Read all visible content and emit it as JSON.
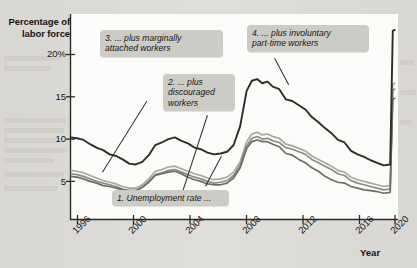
{
  "axes": {
    "y_title": "Percentage of\nlabor force",
    "x_title": "Year",
    "y_ticks": [
      "20%",
      "15",
      "10",
      "5"
    ],
    "x_ticks": [
      "1996",
      "2000",
      "2004",
      "2008",
      "2012",
      "2016",
      "2020"
    ]
  },
  "callouts": [
    {
      "id": "callout-1",
      "text": "1. Unemployment rate ..."
    },
    {
      "id": "callout-2",
      "text": "2. ... plus\ndiscouraged\nworkers"
    },
    {
      "id": "callout-3",
      "text": "3. ... plus marginally\nattached workers"
    },
    {
      "id": "callout-4",
      "text": "4. ... plus involuntary\npart-time workers"
    }
  ],
  "colors": {
    "page_background": "#d9d7d3",
    "plot_background": "#fbfbfa",
    "callout_background": "#cdcbc6",
    "axis": "#2b2926",
    "series_u6": "#2e2c29",
    "series_u5": "#a9a7a2",
    "series_u4": "#8d8b86",
    "series_u3": "#6e6c68"
  },
  "chart_data": {
    "type": "line",
    "title": "",
    "xlabel": "Year",
    "ylabel": "Percentage of labor force",
    "xlim": [
      1995.5,
      2020.6
    ],
    "ylim": [
      0,
      23.5
    ],
    "grid": false,
    "legend": "annotations-as-callouts",
    "xticks": [
      1996,
      2000,
      2004,
      2008,
      2012,
      2016,
      2020
    ],
    "yticks": [
      5,
      10,
      15,
      20
    ],
    "ytick_labels": [
      "5",
      "10",
      "15",
      "20%"
    ],
    "series": [
      {
        "name": "4. ... plus involuntary part-time workers",
        "key": "u6",
        "color": "#2e2c29",
        "x": [
          1995.5,
          1996,
          1996.5,
          1997,
          1997.5,
          1998,
          1998.5,
          1999,
          1999.5,
          2000,
          2000.5,
          2001,
          2001.5,
          2002,
          2002.5,
          2003,
          2003.5,
          2004,
          2004.5,
          2005,
          2005.5,
          2006,
          2006.5,
          2007,
          2007.5,
          2008,
          2008.5,
          2009,
          2009.4,
          2009.8,
          2010.2,
          2010.6,
          2011,
          2011.5,
          2012,
          2012.5,
          2013,
          2013.5,
          2014,
          2014.5,
          2015,
          2015.5,
          2016,
          2016.5,
          2017,
          2017.5,
          2018,
          2018.5,
          2019,
          2019.5,
          2020,
          2020.2,
          2020.35
        ],
        "y": [
          10.2,
          10.1,
          9.9,
          9.4,
          9.0,
          8.7,
          8.2,
          8.0,
          7.6,
          7.1,
          7.0,
          7.3,
          8.1,
          9.3,
          9.6,
          10.0,
          10.2,
          9.8,
          9.5,
          9.0,
          8.8,
          8.4,
          8.2,
          8.3,
          8.5,
          9.3,
          11.5,
          15.7,
          16.9,
          17.1,
          16.6,
          16.8,
          16.2,
          15.9,
          14.7,
          14.5,
          14.0,
          13.5,
          12.6,
          12.0,
          11.3,
          10.7,
          9.9,
          9.6,
          8.6,
          8.2,
          7.9,
          7.5,
          7.2,
          6.9,
          7.0,
          22.8,
          22.9
        ]
      },
      {
        "name": "3. ... plus marginally attached workers",
        "key": "u5",
        "color": "#a9a7a2",
        "x": [
          1995.5,
          1996,
          1996.5,
          1997,
          1997.5,
          1998,
          1998.5,
          1999,
          1999.5,
          2000,
          2000.5,
          2001,
          2001.5,
          2002,
          2002.5,
          2003,
          2003.5,
          2004,
          2004.5,
          2005,
          2005.5,
          2006,
          2006.5,
          2007,
          2007.5,
          2008,
          2008.5,
          2009,
          2009.4,
          2009.8,
          2010.2,
          2010.6,
          2011,
          2011.5,
          2012,
          2012.5,
          2013,
          2013.5,
          2014,
          2014.5,
          2015,
          2015.5,
          2016,
          2016.5,
          2017,
          2017.5,
          2018,
          2018.5,
          2019,
          2019.5,
          2020,
          2020.2,
          2020.35
        ],
        "y": [
          6.3,
          6.2,
          6.0,
          5.7,
          5.4,
          5.1,
          4.9,
          4.7,
          4.4,
          4.2,
          4.2,
          4.6,
          5.3,
          6.2,
          6.4,
          6.7,
          6.8,
          6.5,
          6.2,
          5.9,
          5.7,
          5.4,
          5.2,
          5.3,
          5.5,
          6.1,
          7.3,
          9.7,
          10.6,
          10.8,
          10.5,
          10.6,
          10.3,
          10.1,
          9.4,
          9.2,
          8.9,
          8.6,
          8.0,
          7.6,
          7.2,
          6.8,
          6.3,
          6.1,
          5.5,
          5.2,
          5.0,
          4.8,
          4.6,
          4.4,
          4.5,
          16.5,
          16.6
        ]
      },
      {
        "name": "2. ... plus discouraged workers",
        "key": "u4",
        "color": "#8d8b86",
        "x": [
          1995.5,
          1996,
          1996.5,
          1997,
          1997.5,
          1998,
          1998.5,
          1999,
          1999.5,
          2000,
          2000.5,
          2001,
          2001.5,
          2002,
          2002.5,
          2003,
          2003.5,
          2004,
          2004.5,
          2005,
          2005.5,
          2006,
          2006.5,
          2007,
          2007.5,
          2008,
          2008.5,
          2009,
          2009.4,
          2009.8,
          2010.2,
          2010.6,
          2011,
          2011.5,
          2012,
          2012.5,
          2013,
          2013.5,
          2014,
          2014.5,
          2015,
          2015.5,
          2016,
          2016.5,
          2017,
          2017.5,
          2018,
          2018.5,
          2019,
          2019.5,
          2020,
          2020.2,
          2020.35
        ],
        "y": [
          5.9,
          5.8,
          5.6,
          5.3,
          5.0,
          4.8,
          4.6,
          4.4,
          4.1,
          3.9,
          3.9,
          4.3,
          5.0,
          5.8,
          6.0,
          6.3,
          6.4,
          6.1,
          5.8,
          5.5,
          5.3,
          5.0,
          4.8,
          4.9,
          5.1,
          5.7,
          6.9,
          9.2,
          10.1,
          10.3,
          10.0,
          10.1,
          9.8,
          9.6,
          9.0,
          8.8,
          8.5,
          8.2,
          7.6,
          7.2,
          6.8,
          6.4,
          5.9,
          5.7,
          5.1,
          4.8,
          4.6,
          4.4,
          4.2,
          4.0,
          4.1,
          15.8,
          15.9
        ]
      },
      {
        "name": "1. Unemployment rate ...",
        "key": "u3",
        "color": "#6e6c68",
        "x": [
          1995.5,
          1996,
          1996.5,
          1997,
          1997.5,
          1998,
          1998.5,
          1999,
          1999.5,
          2000,
          2000.5,
          2001,
          2001.5,
          2002,
          2002.5,
          2003,
          2003.5,
          2004,
          2004.5,
          2005,
          2005.5,
          2006,
          2006.5,
          2007,
          2007.5,
          2008,
          2008.5,
          2009,
          2009.4,
          2009.8,
          2010.2,
          2010.6,
          2011,
          2011.5,
          2012,
          2012.5,
          2013,
          2013.5,
          2014,
          2014.5,
          2015,
          2015.5,
          2016,
          2016.5,
          2017,
          2017.5,
          2018,
          2018.5,
          2019,
          2019.5,
          2020,
          2020.2,
          2020.35
        ],
        "y": [
          5.6,
          5.5,
          5.3,
          5.0,
          4.8,
          4.5,
          4.4,
          4.2,
          4.0,
          3.9,
          3.9,
          4.3,
          4.9,
          5.7,
          5.9,
          6.1,
          6.2,
          5.9,
          5.5,
          5.2,
          5.0,
          4.7,
          4.6,
          4.6,
          4.8,
          5.4,
          6.6,
          8.9,
          9.7,
          9.9,
          9.7,
          9.7,
          9.4,
          9.1,
          8.3,
          8.1,
          7.6,
          7.2,
          6.6,
          6.2,
          5.6,
          5.2,
          4.9,
          4.8,
          4.4,
          4.2,
          4.0,
          3.9,
          3.8,
          3.6,
          3.7,
          14.7,
          14.8
        ]
      }
    ]
  }
}
